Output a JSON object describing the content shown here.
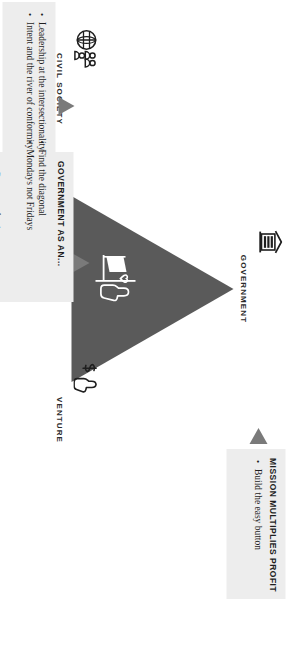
{
  "diagram": {
    "triangle": {
      "fill_color": "#5a5a5a",
      "center_icon": "flag-heart-hand-icon"
    },
    "vertices": [
      {
        "id": "government",
        "label": "GOVERNMENT",
        "icon": "classical-building-icon"
      },
      {
        "id": "venture",
        "label": "VENTURE",
        "icon": "hand-dollar-icon"
      },
      {
        "id": "civil-society",
        "label": "CIVIL SOCIETY",
        "icon": "globe-people-icon"
      }
    ],
    "callouts": [
      {
        "id": "government",
        "title": "Government as an...",
        "bullets": [
          "Enabler of trust",
          "Orchestrator of mission",
          "Developer of talent",
          "Mobilizer of capital",
          "Procurer of value"
        ],
        "background_color": "#ededed",
        "pointer_color": "#7a7a7a"
      },
      {
        "id": "venture",
        "title": "Mission multiplies profit",
        "bullets": [
          "Build the easy button"
        ],
        "background_color": "#ededed",
        "pointer_color": "#7a7a7a"
      },
      {
        "id": "civil-society",
        "title": "",
        "bullets": [
          "Leadership at the intersectionality",
          "Intent and the river of conformity",
          "Find the diagonal",
          "Mondays not Fridays"
        ],
        "background_color": "#ededed",
        "pointer_color": "#7a7a7a"
      }
    ]
  }
}
